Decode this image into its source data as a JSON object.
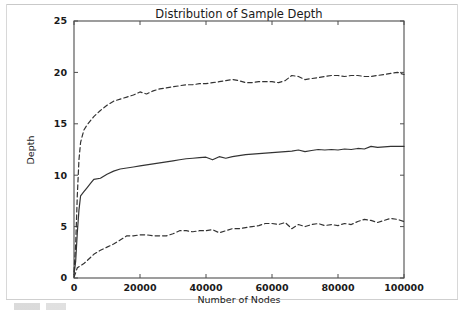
{
  "figure": {
    "background_color": "#ffffff",
    "axes_color": "#4d4d4d",
    "text_color": "#1a1a1a"
  },
  "chart_data": {
    "type": "line",
    "title": "Distribution of Sample Depth",
    "xlabel": "Number of Nodes",
    "ylabel": "Depth",
    "xlim": [
      0,
      100000
    ],
    "ylim": [
      0,
      25
    ],
    "xticks": [
      0,
      20000,
      40000,
      60000,
      80000,
      100000
    ],
    "xtick_labels": [
      "0",
      "20000",
      "40000",
      "60000",
      "80000",
      "100000"
    ],
    "yticks": [
      0,
      5,
      10,
      15,
      20,
      25
    ],
    "ytick_labels": [
      "0",
      "5",
      "10",
      "15",
      "20",
      "25"
    ],
    "grid": false,
    "legend": null,
    "line_color": "#333333",
    "x": [
      0,
      500,
      1000,
      1500,
      2000,
      3000,
      4000,
      5000,
      6000,
      8000,
      10000,
      12000,
      14000,
      16000,
      18000,
      20000,
      22000,
      24000,
      26000,
      28000,
      30000,
      32000,
      34000,
      36000,
      38000,
      40000,
      42000,
      44000,
      46000,
      48000,
      50000,
      52000,
      54000,
      56000,
      58000,
      60000,
      62000,
      64000,
      66000,
      68000,
      70000,
      72000,
      74000,
      76000,
      78000,
      80000,
      82000,
      84000,
      86000,
      88000,
      90000,
      92000,
      94000,
      96000,
      98000,
      100000
    ],
    "series": [
      {
        "name": "upper",
        "style": "dashed",
        "values": [
          0.6,
          3.2,
          8.0,
          11.5,
          13.2,
          14.4,
          14.9,
          15.3,
          15.7,
          16.3,
          16.8,
          17.2,
          17.4,
          17.6,
          17.8,
          18.1,
          17.9,
          18.2,
          18.4,
          18.5,
          18.6,
          18.7,
          18.8,
          18.8,
          18.9,
          18.9,
          19.0,
          19.1,
          19.2,
          19.3,
          19.2,
          19.0,
          19.0,
          19.1,
          19.1,
          19.1,
          19.0,
          19.2,
          19.7,
          19.6,
          19.3,
          19.4,
          19.5,
          19.6,
          19.7,
          19.7,
          19.6,
          19.7,
          19.7,
          19.6,
          19.6,
          19.7,
          19.8,
          19.9,
          20.0,
          19.8
        ]
      },
      {
        "name": "mean",
        "style": "solid",
        "values": [
          0.3,
          1.6,
          4.4,
          6.6,
          8.0,
          8.4,
          8.8,
          9.2,
          9.6,
          9.7,
          10.1,
          10.4,
          10.6,
          10.7,
          10.8,
          10.9,
          11.0,
          11.1,
          11.2,
          11.3,
          11.4,
          11.5,
          11.6,
          11.65,
          11.7,
          11.75,
          11.5,
          11.8,
          11.65,
          11.8,
          11.9,
          12.0,
          12.05,
          12.1,
          12.15,
          12.2,
          12.25,
          12.3,
          12.35,
          12.45,
          12.3,
          12.4,
          12.5,
          12.45,
          12.5,
          12.45,
          12.55,
          12.5,
          12.6,
          12.55,
          12.8,
          12.7,
          12.75,
          12.8,
          12.8,
          12.8
        ]
      },
      {
        "name": "lower",
        "style": "dashed",
        "values": [
          0.1,
          0.5,
          1.0,
          1.1,
          1.2,
          1.4,
          1.7,
          2.0,
          2.3,
          2.7,
          3.0,
          3.3,
          3.7,
          4.1,
          4.1,
          4.2,
          4.2,
          4.1,
          4.1,
          4.1,
          4.3,
          4.6,
          4.6,
          4.5,
          4.6,
          4.6,
          4.7,
          4.4,
          4.6,
          4.8,
          4.8,
          4.9,
          5.0,
          5.1,
          5.3,
          5.3,
          5.2,
          5.4,
          4.8,
          5.2,
          5.0,
          5.2,
          5.3,
          5.1,
          5.2,
          5.1,
          5.3,
          5.2,
          5.5,
          5.7,
          5.6,
          5.4,
          5.6,
          5.8,
          5.7,
          5.5
        ]
      }
    ]
  }
}
